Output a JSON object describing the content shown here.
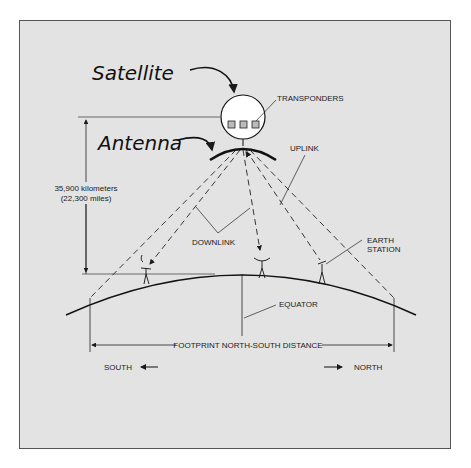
{
  "diagram": {
    "title_labels": {
      "satellite": "Satellite",
      "antenna": "Antenna"
    },
    "labels": {
      "transponders": "TRANSPONDERS",
      "uplink": "UPLINK",
      "downlink": "DOWNLINK",
      "earth_station_1": "EARTH",
      "earth_station_2": "STATION",
      "equator": "EQUATOR",
      "distance_km": "35,900 kilometers",
      "distance_mi": "(22,300 miles)",
      "footprint": "FOOTPRINT NORTH-SOUTH DISTANCE",
      "south": "SOUTH",
      "north": "NORTH"
    },
    "colors": {
      "background": "#e3e3e3",
      "ink": "#1a1a1a",
      "satellite_fill": "#ffffff"
    }
  }
}
